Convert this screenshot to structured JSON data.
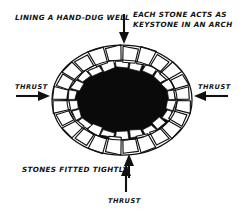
{
  "figure": {
    "title_alt": "Lining a hand-dug well - stone arch ring diagram",
    "style": "hand-drawn ink line illustration",
    "colors": {
      "background": "#ffffff",
      "ink": "#111111",
      "shaft_fill": "#0a0a0a",
      "stone_fill": "#ffffff"
    }
  },
  "labels": {
    "top_left": "LINING A HAND-DUG WELL",
    "top_right_line1": "EACH STONE ACTS AS",
    "top_right_line2": "KEYSTONE IN AN ARCH",
    "left_thrust": "THRUST",
    "right_thrust": "THRUST",
    "bottom_left": "STONES FITTED TIGHTLY",
    "bottom_thrust": "THRUST"
  },
  "arrows": [
    {
      "name": "top-down-arrow",
      "direction": "down",
      "points_to": "well-rim-stones"
    },
    {
      "name": "left-thrust-arrow",
      "direction": "right",
      "points_to": "well-ring-left"
    },
    {
      "name": "right-thrust-arrow",
      "direction": "left",
      "points_to": "well-ring-right"
    },
    {
      "name": "stones-fitted-arrow",
      "direction": "up",
      "points_to": "well-ring-bottom"
    },
    {
      "name": "bottom-thrust-arrow",
      "direction": "up",
      "points_to": "well-ring-bottom"
    }
  ],
  "diagram_parts": {
    "outer_ring": "ring of trapezoidal cut stones forming the well collar",
    "inner_ring": "second course of smaller stones below the rim",
    "shaft": "dark elliptical opening of the well shaft",
    "outer_stone_count": 24,
    "inner_stone_count": 22
  }
}
